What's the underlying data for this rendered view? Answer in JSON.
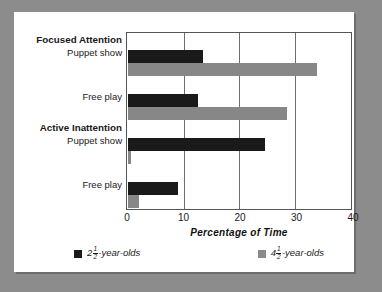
{
  "chart_data": {
    "type": "bar",
    "orientation": "horizontal",
    "title": "",
    "xlabel": "Percentage of Time",
    "ylabel": "",
    "xlim": [
      0,
      40
    ],
    "xticks": [
      0,
      10,
      20,
      30,
      40
    ],
    "xtick_labels": [
      "0",
      "10",
      "20",
      "30",
      "40"
    ],
    "grid": "vertical",
    "legend_position": "bottom",
    "groups": [
      {
        "name": "Focused Attention",
        "categories": [
          "Puppet show",
          "Free play"
        ]
      },
      {
        "name": "Active Inattention",
        "categories": [
          "Puppet show",
          "Free play"
        ]
      }
    ],
    "categories": [
      "Focused Attention - Puppet show",
      "Focused Attention - Free play",
      "Active Inattention - Puppet show",
      "Active Inattention - Free play"
    ],
    "series": [
      {
        "name": "2 1/2 -year-olds",
        "color": "#1a1a1a",
        "values": [
          13.5,
          12.7,
          24.7,
          9.0
        ]
      },
      {
        "name": "4 1/2 -year-olds",
        "color": "#878787",
        "values": [
          34.0,
          28.7,
          0.5,
          2.0
        ]
      }
    ]
  },
  "axis": {
    "x_title": "Percentage of Time",
    "ticks": [
      "0",
      "10",
      "20",
      "30",
      "40"
    ]
  },
  "groups": {
    "focused": {
      "header": "Focused Attention",
      "cat1": "Puppet show",
      "cat2": "Free play"
    },
    "inattention": {
      "header": "Active Inattention",
      "cat1": "Puppet show",
      "cat2": "Free play"
    }
  },
  "legend": {
    "items": [
      {
        "whole": "2",
        "numerator": "1",
        "denominator": "2",
        "suffix": "-year-olds",
        "color": "#1a1a1a"
      },
      {
        "whole": "4",
        "numerator": "1",
        "denominator": "2",
        "suffix": "-year-olds",
        "color": "#8a8a8a"
      }
    ]
  }
}
